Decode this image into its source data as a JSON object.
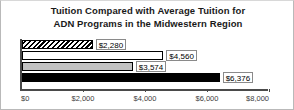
{
  "chart_data": {
    "type": "bar",
    "orientation": "horizontal",
    "title": "Tuition Compared with Average Tuition for ADN Programs in the Midwestern Region",
    "title_lines": [
      "Tuition Compared with Average Tuition for",
      "ADN Programs in the Midwestern Region"
    ],
    "xlabel": "",
    "ylabel": "",
    "xlim": [
      0,
      8000
    ],
    "grid": false,
    "legend": "none",
    "tick_labels": [
      "$0",
      "$2,000",
      "$4,000",
      "$6,000",
      "$8,000"
    ],
    "tick_values": [
      0,
      2000,
      4000,
      6000,
      8000
    ],
    "categories": [
      "Series 1",
      "Series 2",
      "Series 3",
      "Series 4"
    ],
    "values": [
      2280,
      4560,
      3574,
      6376
    ],
    "data_labels": [
      "$2,280",
      "$4,560",
      "$3,574",
      "$6,376"
    ],
    "bar_styles": [
      "hatch",
      "white",
      "gray",
      "black"
    ],
    "bars": [
      {
        "label": "$2,280",
        "value": 2280,
        "style": "hatch"
      },
      {
        "label": "$4,560",
        "value": 4560,
        "style": "white"
      },
      {
        "label": "$3,574",
        "value": 3574,
        "style": "gray"
      },
      {
        "label": "$6,376",
        "value": 6376,
        "style": "black"
      }
    ],
    "colors": {
      "bar_outline": "#000000",
      "bar_gray": "#c2c2c2",
      "bar_black": "#000000",
      "bar_white": "#ffffff",
      "axis": "#4a4a4a",
      "text": "#1a1a1a",
      "background": "#ffffff"
    }
  }
}
